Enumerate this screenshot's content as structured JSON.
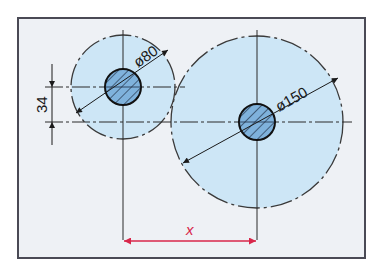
{
  "diagram": {
    "type": "technical-drawing",
    "colors": {
      "paper": "#eef1f5",
      "frame": "#4a4a55",
      "disc_fill": "#cde6f6",
      "hub_fill": "#7fb2dc",
      "line": "#2a2a2a",
      "dimension_accent": "#d8264a"
    },
    "small_disc": {
      "diameter_label": "ø80",
      "center": [
        123,
        87
      ],
      "radius": 52,
      "hub_radius": 18
    },
    "large_disc": {
      "diameter_label": "ø150",
      "center": [
        257,
        122
      ],
      "radius": 86,
      "hub_radius": 18
    },
    "vertical_offset": {
      "label": "34"
    },
    "center_distance": {
      "label": "x"
    }
  }
}
